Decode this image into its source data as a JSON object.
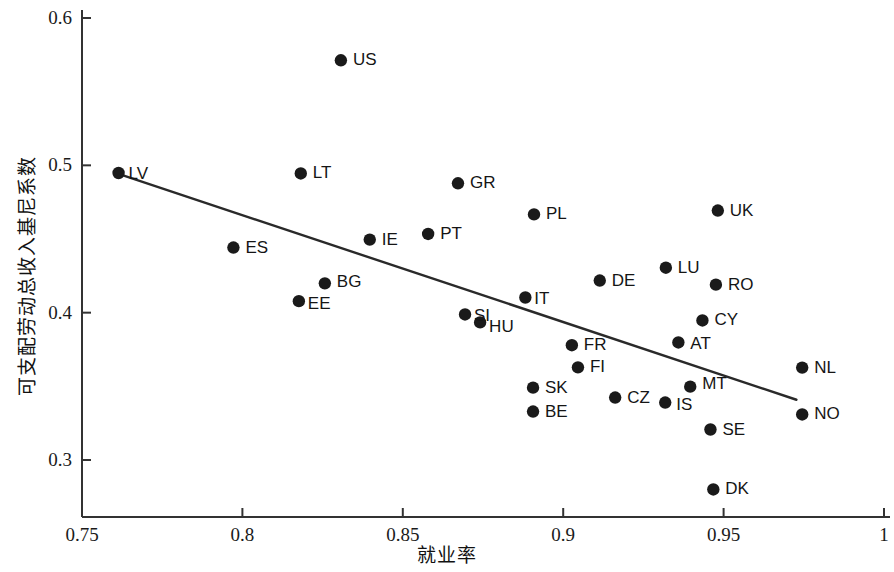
{
  "chart_data": {
    "type": "scatter",
    "title": "",
    "xlabel": "就业率",
    "ylabel": "可支配劳动总收入基尼系数",
    "xlim": [
      0.75,
      1.0
    ],
    "ylim": [
      0.275,
      0.605
    ],
    "grid": false,
    "legend": false,
    "xticks": [
      "0.75",
      "0.8",
      "0.85",
      "0.9",
      "0.95",
      "1"
    ],
    "xtick_values": [
      0.75,
      0.8,
      0.85,
      0.9,
      0.95,
      1.0
    ],
    "yticks": [
      "0.3",
      "0.4",
      "0.5",
      "0.6"
    ],
    "ytick_values": [
      0.3,
      0.4,
      0.5,
      0.6
    ],
    "marker_color": "#1a1a1a",
    "line_color": "#2a2a2a",
    "points": [
      {
        "label": "LV",
        "x": 0.7614,
        "y": 0.4948,
        "lx": 10,
        "ly": 1
      },
      {
        "label": "US",
        "x": 0.8307,
        "y": 0.5713,
        "lx": 12,
        "ly": 0
      },
      {
        "label": "LT",
        "x": 0.8182,
        "y": 0.4945,
        "lx": 12,
        "ly": 0
      },
      {
        "label": "GR",
        "x": 0.8672,
        "y": 0.4878,
        "lx": 12,
        "ly": 0
      },
      {
        "label": "PL",
        "x": 0.8909,
        "y": 0.4667,
        "lx": 12,
        "ly": 0
      },
      {
        "label": "UK",
        "x": 0.9482,
        "y": 0.4693,
        "lx": 12,
        "ly": 0
      },
      {
        "label": "ES",
        "x": 0.7972,
        "y": 0.4442,
        "lx": 12,
        "ly": 0
      },
      {
        "label": "IE",
        "x": 0.8397,
        "y": 0.4496,
        "lx": 12,
        "ly": 0
      },
      {
        "label": "PT",
        "x": 0.8579,
        "y": 0.4534,
        "lx": 12,
        "ly": 0
      },
      {
        "label": "BG",
        "x": 0.8257,
        "y": 0.4199,
        "lx": 12,
        "ly": -1
      },
      {
        "label": "EE",
        "x": 0.8176,
        "y": 0.4078,
        "lx": 9,
        "ly": 3
      },
      {
        "label": "DE",
        "x": 0.9114,
        "y": 0.4218,
        "lx": 12,
        "ly": 0
      },
      {
        "label": "LU",
        "x": 0.932,
        "y": 0.4305,
        "lx": 12,
        "ly": 0
      },
      {
        "label": "RO",
        "x": 0.9476,
        "y": 0.419,
        "lx": 12,
        "ly": 0
      },
      {
        "label": "IT",
        "x": 0.8882,
        "y": 0.4103,
        "lx": 9,
        "ly": 2
      },
      {
        "label": "SI",
        "x": 0.8694,
        "y": 0.3988,
        "lx": 9,
        "ly": 2
      },
      {
        "label": "HU",
        "x": 0.8741,
        "y": 0.3934,
        "lx": 9,
        "ly": 5
      },
      {
        "label": "CY",
        "x": 0.9434,
        "y": 0.3947,
        "lx": 12,
        "ly": 0
      },
      {
        "label": "AT",
        "x": 0.9359,
        "y": 0.3798,
        "lx": 12,
        "ly": 2
      },
      {
        "label": "FR",
        "x": 0.9027,
        "y": 0.3779,
        "lx": 12,
        "ly": 0
      },
      {
        "label": "FI",
        "x": 0.9046,
        "y": 0.3629,
        "lx": 12,
        "ly": 0
      },
      {
        "label": "NL",
        "x": 0.9745,
        "y": 0.3627,
        "lx": 12,
        "ly": 0
      },
      {
        "label": "SK",
        "x": 0.8906,
        "y": 0.3491,
        "lx": 12,
        "ly": 0
      },
      {
        "label": "MT",
        "x": 0.9396,
        "y": 0.3498,
        "lx": 12,
        "ly": -3
      },
      {
        "label": "CZ",
        "x": 0.9162,
        "y": 0.3424,
        "lx": 12,
        "ly": 0
      },
      {
        "label": "IS",
        "x": 0.9318,
        "y": 0.339,
        "lx": 11,
        "ly": 2
      },
      {
        "label": "BE",
        "x": 0.8906,
        "y": 0.3329,
        "lx": 12,
        "ly": 0
      },
      {
        "label": "NO",
        "x": 0.9745,
        "y": 0.3309,
        "lx": 12,
        "ly": 0
      },
      {
        "label": "SE",
        "x": 0.9459,
        "y": 0.3207,
        "lx": 12,
        "ly": 0
      },
      {
        "label": "DK",
        "x": 0.9468,
        "y": 0.28,
        "lx": 12,
        "ly": 0
      }
    ],
    "trendline": {
      "x_start": 0.7614,
      "y_start": 0.4942,
      "x_end": 0.9727,
      "y_end": 0.3409
    }
  }
}
